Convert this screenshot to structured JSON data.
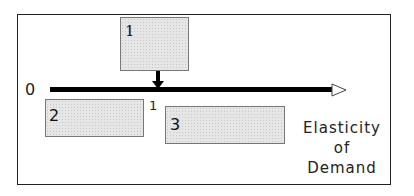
{
  "diagram": {
    "axis": {
      "origin_label": "0",
      "tick_label": "1",
      "label_line1": "Elasticity",
      "label_line2": "of",
      "label_line3": "Demand"
    },
    "boxes": [
      {
        "label": "1",
        "position": "above axis at elasticity = 1, arrow pointing down"
      },
      {
        "label": "2",
        "position": "below axis, between 0 and 1"
      },
      {
        "label": "3",
        "position": "below axis, beyond 1"
      }
    ]
  }
}
